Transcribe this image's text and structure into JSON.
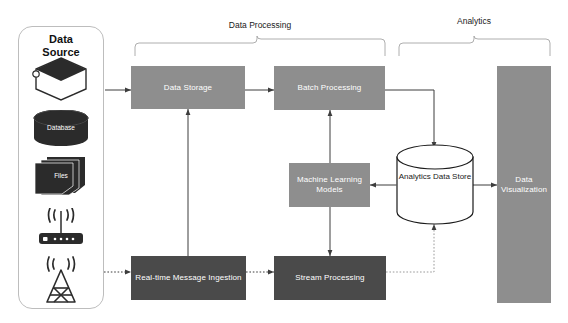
{
  "diagram": {
    "groups": [
      {
        "id": "data-processing",
        "label": "Data Processing"
      },
      {
        "id": "analytics",
        "label": "Analytics"
      }
    ],
    "data_source": {
      "title_line1": "Data",
      "title_line2": "Source",
      "items": [
        {
          "id": "services",
          "label": "Services",
          "icon": "hexagon-services-icon"
        },
        {
          "id": "database",
          "label": "Database",
          "icon": "database-cylinder-icon"
        },
        {
          "id": "files",
          "label": "Files",
          "icon": "stacked-files-icon"
        },
        {
          "id": "router",
          "label": "",
          "icon": "wifi-router-icon"
        },
        {
          "id": "tower",
          "label": "",
          "icon": "radio-tower-icon"
        }
      ]
    },
    "nodes": [
      {
        "id": "data-storage",
        "label": "Data Storage",
        "tone": "light"
      },
      {
        "id": "batch-processing",
        "label": "Batch Processing",
        "tone": "light"
      },
      {
        "id": "machine-learning-models",
        "label": "Machine Learning Models",
        "tone": "light"
      },
      {
        "id": "data-visualization",
        "label": "Data Visualization",
        "tone": "light"
      },
      {
        "id": "realtime-message-ingestion",
        "label": "Real-time Message Ingestion",
        "tone": "dark"
      },
      {
        "id": "stream-processing",
        "label": "Stream Processing",
        "tone": "dark"
      },
      {
        "id": "analytics-data-store",
        "label": "Analytics Data Store",
        "tone": "cylinder"
      }
    ],
    "edges": [
      {
        "id": "source-to-storage",
        "from": "data-source",
        "to": "data-storage",
        "style": "solid"
      },
      {
        "id": "storage-to-batch",
        "from": "data-storage",
        "to": "batch-processing",
        "style": "solid"
      },
      {
        "id": "batch-to-store",
        "from": "batch-processing",
        "to": "analytics-data-store",
        "style": "solid"
      },
      {
        "id": "storage-ingestion",
        "from": "realtime-message-ingestion",
        "to": "data-storage",
        "style": "solid-bidirectional"
      },
      {
        "id": "batch-ml",
        "from": "machine-learning-models",
        "to": "batch-processing",
        "style": "solid-bidirectional"
      },
      {
        "id": "ml-stream",
        "from": "machine-learning-models",
        "to": "stream-processing",
        "style": "solid-bidirectional"
      },
      {
        "id": "ml-to-store",
        "from": "analytics-data-store",
        "to": "machine-learning-models",
        "style": "solid-bidirectional"
      },
      {
        "id": "store-to-visualization",
        "from": "analytics-data-store",
        "to": "data-visualization",
        "style": "solid"
      },
      {
        "id": "tower-to-ingestion",
        "from": "data-source",
        "to": "realtime-message-ingestion",
        "style": "dotted"
      },
      {
        "id": "ingestion-to-stream",
        "from": "realtime-message-ingestion",
        "to": "stream-processing",
        "style": "dotted"
      },
      {
        "id": "stream-to-store",
        "from": "stream-processing",
        "to": "analytics-data-store",
        "style": "dotted"
      }
    ],
    "colors": {
      "light_node": "#8e8e8e",
      "dark_node": "#4a4a4a",
      "panel_border": "#bdbdbd",
      "connector": "#3d3d3d",
      "background": "#ffffff"
    }
  }
}
